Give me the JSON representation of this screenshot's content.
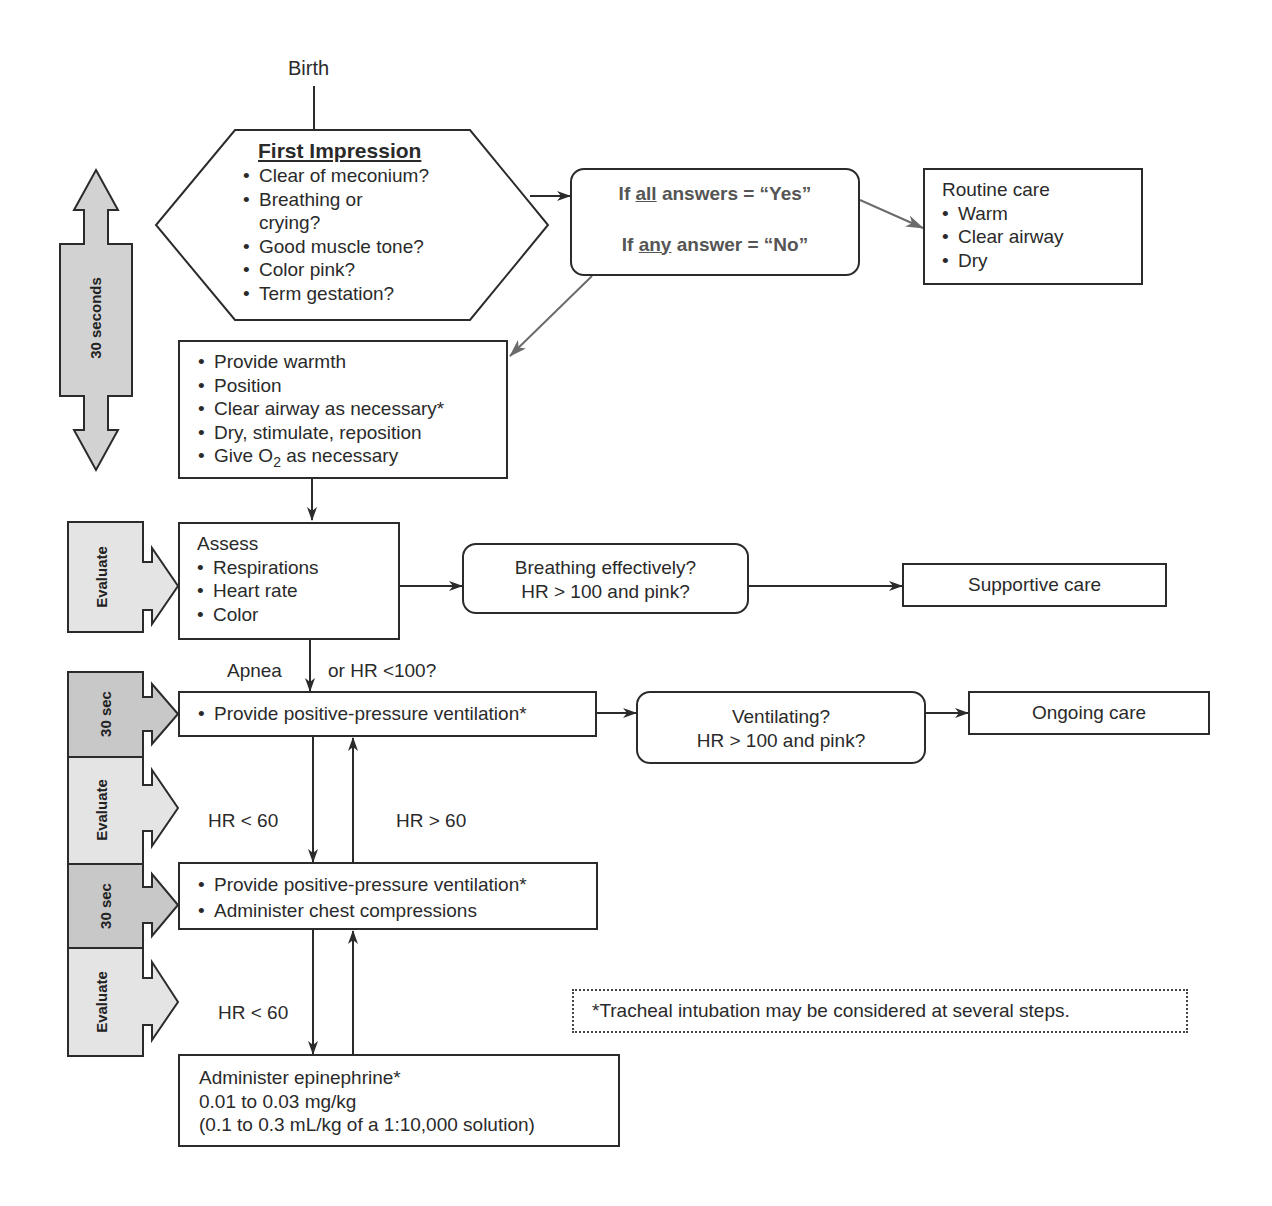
{
  "start_label": "Birth",
  "first_impression": {
    "title": "First Impression",
    "items": [
      "Clear of meconium?",
      "Breathing or",
      "crying?",
      "Good muscle tone?",
      "Color pink?",
      "Term gestation?"
    ]
  },
  "decision_box": {
    "yes_prefix": "If ",
    "yes_emph": "all",
    "yes_suffix": " answers = “Yes”",
    "no_prefix": "If ",
    "no_emph": "any",
    "no_suffix": " answer = “No”"
  },
  "routine_care": {
    "title": "Routine care",
    "items": [
      "Warm",
      "Clear airway",
      "Dry"
    ]
  },
  "initial_steps": {
    "items": [
      "Provide warmth",
      "Position",
      "Clear airway as necessary*",
      "Dry, stimulate, reposition"
    ],
    "o2_prefix": "Give O",
    "o2_sub": "2",
    "o2_suffix": " as necessary"
  },
  "timeline": {
    "thirty_seconds": "30 seconds",
    "evaluate": "Evaluate",
    "thirty_sec": "30 sec"
  },
  "assess": {
    "title": "Assess",
    "items": [
      "Respirations",
      "Heart rate",
      "Color"
    ]
  },
  "breathing_check": {
    "line1": "Breathing effectively?",
    "line2": "HR > 100 and pink?"
  },
  "supportive_care": "Supportive care",
  "apnea_label": {
    "left": "Apnea",
    "right": "or HR <100?"
  },
  "ppv_box": {
    "item": "Provide positive-pressure ventilation*"
  },
  "ventilating_check": {
    "line1": "Ventilating?",
    "line2": "HR > 100 and pink?"
  },
  "ongoing_care": "Ongoing care",
  "hr_lt_60_a": "HR < 60",
  "hr_gt_60": "HR > 60",
  "compressions_box": {
    "items": [
      "Provide positive-pressure ventilation*",
      "Administer chest compressions"
    ]
  },
  "hr_lt_60_b": "HR < 60",
  "epinephrine_box": {
    "line1": "Administer epinephrine*",
    "line2": "0.01 to 0.03 mg/kg",
    "line3": "(0.1 to 0.3 mL/kg of a 1:10,000 solution)"
  },
  "footnote": "*Tracheal intubation may be considered at several steps.",
  "colors": {
    "line": "#2b2b2b",
    "gray_arrow": "#6b6b6b",
    "timeline_dark": "#c8c8c8",
    "timeline_light": "#e4e4e4"
  }
}
